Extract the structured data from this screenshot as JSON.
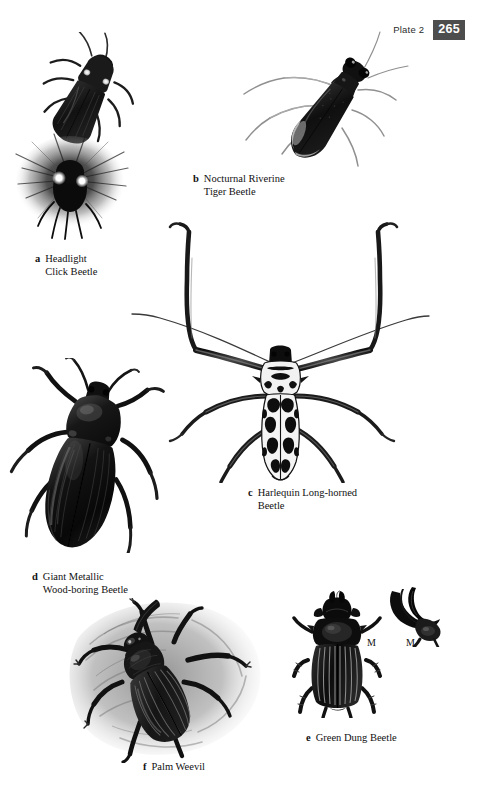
{
  "page": {
    "width": 477,
    "height": 807,
    "background_color": "#ffffff",
    "type": "illustrated-book-plate"
  },
  "header": {
    "plate_label": "Plate 2",
    "page_number": "265",
    "badge_background": "#4d4d4d",
    "badge_text_color": "#ffffff"
  },
  "figures": [
    {
      "letter": "a",
      "name": "Headlight Click Beetle",
      "caption_line_1": "Headlight",
      "caption_line_2": "Click Beetle",
      "caption_full": "Headlight\nClick Beetle",
      "illustrations": [
        {
          "id": "headlight-click-beetle",
          "view": "dorsal-diagonal",
          "note": "dark elongated click beetle with two pale pronotal luminescent spots"
        },
        {
          "id": "headlight-click-beetle-glowing",
          "view": "glowing",
          "note": "beetle shown bioluminescing with radiating light halo"
        }
      ]
    },
    {
      "letter": "b",
      "name": "Nocturnal Riverine Tiger Beetle",
      "caption_line_1": "Nocturnal Riverine",
      "caption_line_2": "Tiger Beetle",
      "caption_full": "Nocturnal Riverine\nTiger Beetle",
      "illustrations": [
        {
          "id": "nocturnal-riverine-tiger-beetle",
          "view": "dorsal-oblique",
          "note": "long-legged dark tiger beetle with pale elytral markings and long antennae"
        }
      ]
    },
    {
      "letter": "c",
      "name": "Harlequin Long-horned Beetle",
      "caption_line_1": "Harlequin Long-horned",
      "caption_line_2": "Beetle",
      "caption_full": "Harlequin Long-horned\nBeetle",
      "illustrations": [
        {
          "id": "harlequin-long-horned-beetle",
          "view": "dorsal-symmetrical",
          "note": "very long curved forelegs, patterned black and white elytra, long antennae"
        }
      ]
    },
    {
      "letter": "d",
      "name": "Giant Metallic Wood-boring Beetle",
      "caption_line_1": "Giant Metallic",
      "caption_line_2": "Wood-boring Beetle",
      "caption_full": "Giant Metallic\nWood-boring Beetle",
      "illustrations": [
        {
          "id": "giant-metallic-wood-boring-beetle",
          "view": "dorsal",
          "note": "large glossy black buprestid with broad pronotum and ridged elytra"
        }
      ]
    },
    {
      "letter": "e",
      "name": "Green Dung Beetle",
      "caption_line_1": "Green Dung Beetle",
      "caption_line_2": "",
      "caption_full": "Green Dung Beetle",
      "illustrations": [
        {
          "id": "green-dung-beetle",
          "view": "dorsal",
          "note": "symmetrical horned dung beetle with strongly ridged elytra"
        },
        {
          "id": "green-dung-beetle-head-detail",
          "view": "lateral-head",
          "note": "detail of male horned head in profile"
        }
      ],
      "annotations": [
        {
          "label": "M",
          "meaning": "male",
          "position": "left"
        },
        {
          "label": "M",
          "meaning": "male",
          "position": "right"
        }
      ]
    },
    {
      "letter": "f",
      "name": "Palm Weevil",
      "caption_line_1": "Palm Weevil",
      "caption_line_2": "",
      "caption_full": "Palm Weevil",
      "illustrations": [
        {
          "id": "palm-weevil",
          "view": "dorsal-oblique",
          "note": "dark weevil with long curved rostrum on a mottled grey bark background"
        }
      ]
    }
  ],
  "colors": {
    "ink": "#111111",
    "beetle_dark": "#141414",
    "beetle_mid": "#3a3a3a",
    "highlight": "#ffffff",
    "background_texture": "#9a9a9a",
    "badge": "#4d4d4d"
  }
}
